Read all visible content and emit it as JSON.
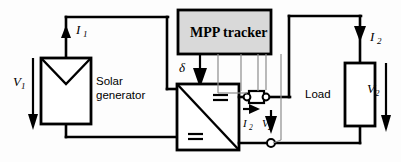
{
  "diagram": {
    "blocks": {
      "solar_generator": {
        "label_line1": "Solar",
        "label_line2": "generator",
        "symbol": "photovoltaic-source-chevron"
      },
      "mpp_tracker": {
        "label": "MPP tracker",
        "fill_color": "#d9d9d9",
        "border_color": "#000000"
      },
      "converter": {
        "symbol": "dc-dc-converter",
        "top_marking": "=",
        "bottom_marking": "=",
        "diagonal": "top-left-to-bottom-right"
      },
      "load": {
        "label": "Load",
        "symbol": "resistor-box"
      },
      "shunt": {
        "symbol": "shunt-resistor",
        "terminal_left": "circle-terminal",
        "terminal_right": "circle-terminal"
      },
      "ground_node": {
        "symbol": "circle-terminal"
      }
    },
    "labels": {
      "current_in": {
        "symbol": "I",
        "sub": "1"
      },
      "voltage_in": {
        "symbol": "V",
        "sub": "1"
      },
      "current_out": {
        "symbol": "I",
        "sub": "2"
      },
      "voltage_out": {
        "symbol": "V",
        "sub": "2"
      },
      "shunt_current": {
        "symbol": "I",
        "sub": "2"
      },
      "shunt_voltage": {
        "symbol": "V",
        "sub": "2"
      },
      "duty_cycle": {
        "symbol": "δ"
      }
    },
    "colors": {
      "wire": "#000000",
      "sense_wire": "#8d8d8d",
      "mpp_fill": "#d9d9d9",
      "background": "#fdfdfd"
    }
  }
}
